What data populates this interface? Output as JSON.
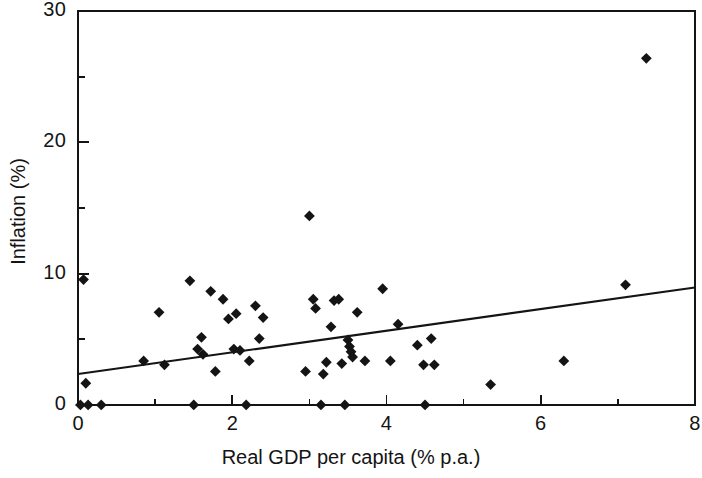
{
  "chart_data": {
    "type": "scatter",
    "title": "",
    "xlabel": "Real GDP per capita (% p.a.)",
    "ylabel": "Inflation  (%)",
    "xlim": [
      0,
      8
    ],
    "ylim": [
      0,
      30
    ],
    "x_major_ticks": [
      0,
      2,
      4,
      6,
      8
    ],
    "x_minor_ticks": [
      1,
      3,
      5,
      7
    ],
    "y_major_ticks": [
      0,
      10,
      20,
      30
    ],
    "y_minor_ticks": [
      5,
      15,
      25
    ],
    "x_tick_labels": [
      "0",
      "2",
      "4",
      "6",
      "8"
    ],
    "y_tick_labels": [
      "0",
      "10",
      "20",
      "30"
    ],
    "grid": false,
    "legend": false,
    "marker": "diamond",
    "marker_color": "#141414",
    "points": [
      {
        "x": 0.07,
        "y": 9.55
      },
      {
        "x": 0.1,
        "y": 1.65
      },
      {
        "x": 0.03,
        "y": 0.0
      },
      {
        "x": 0.13,
        "y": 0.0
      },
      {
        "x": 0.3,
        "y": 0.0
      },
      {
        "x": 0.85,
        "y": 3.35
      },
      {
        "x": 1.05,
        "y": 7.05
      },
      {
        "x": 1.12,
        "y": 3.05
      },
      {
        "x": 1.45,
        "y": 9.45
      },
      {
        "x": 1.5,
        "y": 0.0
      },
      {
        "x": 1.55,
        "y": 4.25
      },
      {
        "x": 1.6,
        "y": 5.15
      },
      {
        "x": 1.62,
        "y": 3.85
      },
      {
        "x": 1.72,
        "y": 8.65
      },
      {
        "x": 1.78,
        "y": 2.55
      },
      {
        "x": 1.88,
        "y": 8.05
      },
      {
        "x": 1.95,
        "y": 6.55
      },
      {
        "x": 2.02,
        "y": 4.25
      },
      {
        "x": 2.05,
        "y": 6.95
      },
      {
        "x": 2.1,
        "y": 4.15
      },
      {
        "x": 2.18,
        "y": 0.0
      },
      {
        "x": 2.22,
        "y": 3.35
      },
      {
        "x": 2.3,
        "y": 7.55
      },
      {
        "x": 2.35,
        "y": 5.05
      },
      {
        "x": 2.4,
        "y": 6.65
      },
      {
        "x": 2.95,
        "y": 2.55
      },
      {
        "x": 3.0,
        "y": 14.4
      },
      {
        "x": 3.05,
        "y": 8.05
      },
      {
        "x": 3.08,
        "y": 7.35
      },
      {
        "x": 3.15,
        "y": 0.0
      },
      {
        "x": 3.18,
        "y": 2.35
      },
      {
        "x": 3.22,
        "y": 3.25
      },
      {
        "x": 3.28,
        "y": 5.95
      },
      {
        "x": 3.32,
        "y": 7.95
      },
      {
        "x": 3.38,
        "y": 8.05
      },
      {
        "x": 3.42,
        "y": 3.15
      },
      {
        "x": 3.46,
        "y": 0.0
      },
      {
        "x": 3.5,
        "y": 4.95
      },
      {
        "x": 3.52,
        "y": 4.45
      },
      {
        "x": 3.54,
        "y": 4.05
      },
      {
        "x": 3.56,
        "y": 3.65
      },
      {
        "x": 3.62,
        "y": 7.05
      },
      {
        "x": 3.72,
        "y": 3.35
      },
      {
        "x": 3.95,
        "y": 8.85
      },
      {
        "x": 4.05,
        "y": 3.35
      },
      {
        "x": 4.15,
        "y": 6.15
      },
      {
        "x": 4.4,
        "y": 4.55
      },
      {
        "x": 4.48,
        "y": 3.05
      },
      {
        "x": 4.5,
        "y": 0.0
      },
      {
        "x": 4.58,
        "y": 5.05
      },
      {
        "x": 4.62,
        "y": 3.05
      },
      {
        "x": 5.35,
        "y": 1.55
      },
      {
        "x": 6.3,
        "y": 3.35
      },
      {
        "x": 7.1,
        "y": 9.15
      },
      {
        "x": 7.37,
        "y": 26.4
      }
    ],
    "trend_line": {
      "x0": 0.0,
      "y0": 2.35,
      "x1": 8.0,
      "y1": 8.95,
      "color": "#141414"
    }
  }
}
